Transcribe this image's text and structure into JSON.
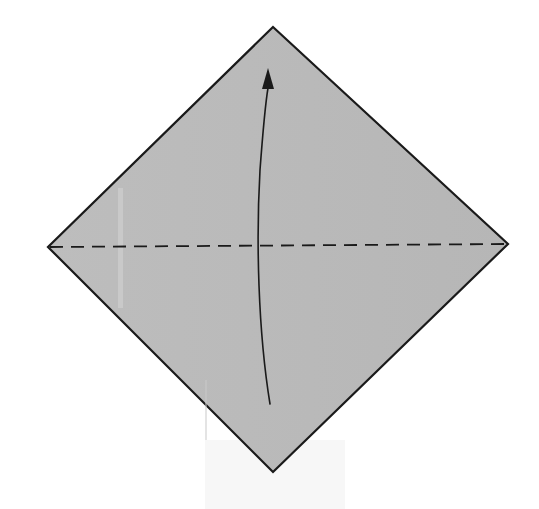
{
  "diagram": {
    "type": "origami-fold-instruction",
    "paper": {
      "shape": "square-rotated-45-diamond",
      "fill_color": "#b9b9b9",
      "edge_color": "#1a1a1a",
      "vertices": {
        "top": [
          273,
          27
        ],
        "right": [
          508,
          244
        ],
        "bottom": [
          273,
          472
        ],
        "left": [
          48,
          247
        ]
      }
    },
    "fold_line": {
      "style": "dashed",
      "kind": "valley-fold",
      "from": [
        48,
        247
      ],
      "to": [
        508,
        244
      ],
      "color": "#1a1a1a"
    },
    "arrow": {
      "direction": "up",
      "meaning": "fold bottom corner up to top corner",
      "start": [
        270,
        404
      ],
      "end": [
        268,
        72
      ],
      "color": "#1a1a1a"
    },
    "background_color": "#ffffff"
  }
}
